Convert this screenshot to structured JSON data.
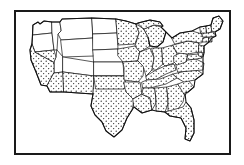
{
  "figure": {
    "type": "thematic-map",
    "region": "Contiguous United States",
    "style": "black-and-white stippled choropleth",
    "frame": {
      "visible": true,
      "color": "#1a1a1a",
      "stroke_width_px": 2,
      "x": 14,
      "y": 10,
      "width": 217,
      "height": 145
    },
    "background_color": "#ffffff",
    "line_color": "#111111",
    "stipple_color": "#111111"
  },
  "legend": {
    "visible": false,
    "categories": [
      {
        "key": "stippled",
        "label": "",
        "fill": "stipple",
        "description": "dot-pattern fill"
      },
      {
        "key": "blank",
        "label": "",
        "fill": "#ffffff",
        "description": "no fill"
      }
    ]
  },
  "map_data": {
    "projection_hint": "simplified continental outline",
    "shaded_fill": "stipple",
    "unshaded_fill": "#ffffff",
    "states": [
      {
        "code": "WA",
        "name": "Washington",
        "shaded": false
      },
      {
        "code": "OR",
        "name": "Oregon",
        "shaded": false
      },
      {
        "code": "ID",
        "name": "Idaho",
        "shaded": false
      },
      {
        "code": "MT",
        "name": "Montana",
        "shaded": false
      },
      {
        "code": "WY",
        "name": "Wyoming",
        "shaded": false
      },
      {
        "code": "ND",
        "name": "North Dakota",
        "shaded": false
      },
      {
        "code": "SD",
        "name": "South Dakota",
        "shaded": false
      },
      {
        "code": "NE",
        "name": "Nebraska",
        "shaded": false
      },
      {
        "code": "CO",
        "name": "Colorado",
        "shaded": false
      },
      {
        "code": "KS",
        "name": "Kansas",
        "shaded": false
      },
      {
        "code": "UT",
        "name": "Utah",
        "shaded": false
      },
      {
        "code": "CA",
        "name": "California",
        "shaded": true
      },
      {
        "code": "NV",
        "name": "Nevada",
        "shaded": true
      },
      {
        "code": "AZ",
        "name": "Arizona",
        "shaded": true
      },
      {
        "code": "NM",
        "name": "New Mexico",
        "shaded": true
      },
      {
        "code": "TX",
        "name": "Texas",
        "shaded": true
      },
      {
        "code": "OK",
        "name": "Oklahoma",
        "shaded": true
      },
      {
        "code": "MN",
        "name": "Minnesota",
        "shaded": true
      },
      {
        "code": "IA",
        "name": "Iowa",
        "shaded": true
      },
      {
        "code": "MO",
        "name": "Missouri",
        "shaded": true
      },
      {
        "code": "AR",
        "name": "Arkansas",
        "shaded": true
      },
      {
        "code": "LA",
        "name": "Louisiana",
        "shaded": true
      },
      {
        "code": "WI",
        "name": "Wisconsin",
        "shaded": true
      },
      {
        "code": "IL",
        "name": "Illinois",
        "shaded": true
      },
      {
        "code": "MI",
        "name": "Michigan",
        "shaded": true
      },
      {
        "code": "IN",
        "name": "Indiana",
        "shaded": true
      },
      {
        "code": "OH",
        "name": "Ohio",
        "shaded": true
      },
      {
        "code": "KY",
        "name": "Kentucky",
        "shaded": true
      },
      {
        "code": "TN",
        "name": "Tennessee",
        "shaded": true
      },
      {
        "code": "MS",
        "name": "Mississippi",
        "shaded": true
      },
      {
        "code": "AL",
        "name": "Alabama",
        "shaded": true
      },
      {
        "code": "GA",
        "name": "Georgia",
        "shaded": true
      },
      {
        "code": "FL",
        "name": "Florida",
        "shaded": true
      },
      {
        "code": "SC",
        "name": "South Carolina",
        "shaded": true
      },
      {
        "code": "NC",
        "name": "North Carolina",
        "shaded": true
      },
      {
        "code": "VA",
        "name": "Virginia",
        "shaded": true
      },
      {
        "code": "WV",
        "name": "West Virginia",
        "shaded": true
      },
      {
        "code": "MD",
        "name": "Maryland",
        "shaded": true
      },
      {
        "code": "DE",
        "name": "Delaware",
        "shaded": true
      },
      {
        "code": "PA",
        "name": "Pennsylvania",
        "shaded": true
      },
      {
        "code": "NJ",
        "name": "New Jersey",
        "shaded": true
      },
      {
        "code": "NY",
        "name": "New York",
        "shaded": true
      },
      {
        "code": "CT",
        "name": "Connecticut",
        "shaded": true
      },
      {
        "code": "RI",
        "name": "Rhode Island",
        "shaded": true
      },
      {
        "code": "MA",
        "name": "Massachusetts",
        "shaded": true
      },
      {
        "code": "VT",
        "name": "Vermont",
        "shaded": true
      },
      {
        "code": "NH",
        "name": "New Hampshire",
        "shaded": true
      },
      {
        "code": "ME",
        "name": "Maine",
        "shaded": true
      }
    ],
    "summary": {
      "shaded_count": 37,
      "unshaded_count": 11
    }
  }
}
